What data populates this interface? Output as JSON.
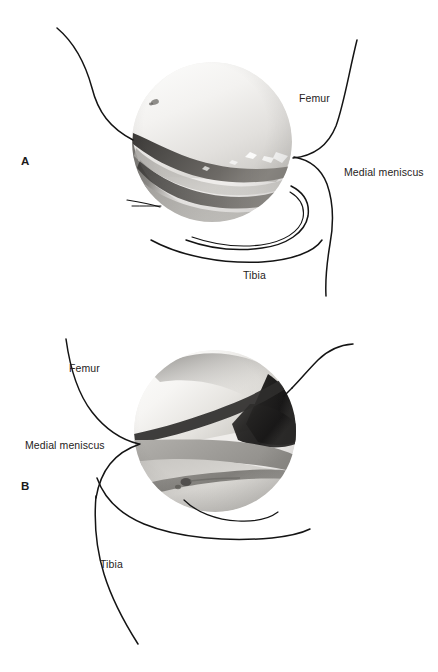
{
  "figure": {
    "background_color": "#ffffff",
    "ink_color": "#141414",
    "label_color": "#262322",
    "width": 438,
    "height": 672,
    "caption_fragment": ""
  },
  "panels": [
    {
      "id": "A",
      "letter": "A",
      "scope_view": {
        "name": "arthroscopic-photo-a",
        "shape": "circle",
        "center_x": 212,
        "center_y": 142,
        "radius": 80,
        "description": "medial compartment arthroscopic view, bright femoral condyle above dark meniscal band"
      },
      "labels": [
        {
          "name": "femur",
          "text": "Femur",
          "x": 299,
          "y": 93
        },
        {
          "name": "medial-meniscus",
          "text": "Medial meniscus",
          "x": 344,
          "y": 167
        },
        {
          "name": "tibia",
          "text": "Tibia",
          "x": 243,
          "y": 270
        }
      ]
    },
    {
      "id": "B",
      "letter": "B",
      "scope_view": {
        "name": "arthroscopic-photo-b",
        "shape": "circle",
        "center_x": 215,
        "center_y": 431,
        "radius": 81,
        "description": "medial compartment arthroscopic view, bright condyle upper left with dark wedge upper right"
      },
      "labels": [
        {
          "name": "femur",
          "text": "Femur",
          "x": 69,
          "y": 363
        },
        {
          "name": "medial-meniscus",
          "text": "Medial meniscus",
          "x": 25,
          "y": 440
        },
        {
          "name": "tibia",
          "text": "Tibia",
          "x": 100,
          "y": 559
        }
      ]
    }
  ],
  "anatomy_terms": [
    "Femur",
    "Medial meniscus",
    "Tibia"
  ]
}
